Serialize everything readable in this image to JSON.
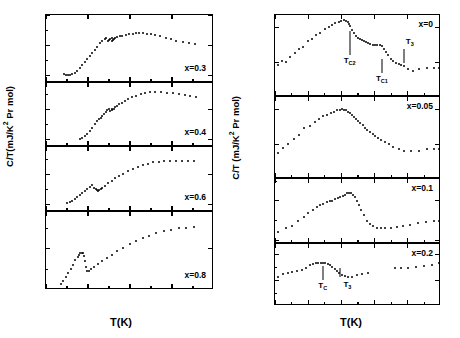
{
  "figure": {
    "background": "#ffffff",
    "marker_color": "#000000"
  },
  "left_group": {
    "ytitle": "C/T(mJ/K",
    "ytitle_sup": "2",
    "ytitle_tail": " Pr mol)",
    "xtitle": "T(K)"
  },
  "right_group": {
    "ytitle": "C/T (mJ/K",
    "ytitle_sup": "2",
    "ytitle_tail": " Pr mol)",
    "xtitle": "T(K)"
  },
  "chart_data": [
    {
      "id": "left-p1",
      "type": "scatter",
      "title": "",
      "xlabel": "T(K)",
      "ylabel": "C/T(mJ/K2 Pr mol)",
      "annotation": "x=0.3",
      "xlim": [
        0,
        4
      ],
      "ylim": [
        -250,
        2000
      ],
      "xticks": [
        0,
        1,
        2,
        3,
        4
      ],
      "xtick_labels": [
        "0",
        "1",
        "2",
        "3",
        "4"
      ],
      "xminor": [
        0.5,
        1.5,
        2.5,
        3.5
      ],
      "yticks": [
        0,
        1000,
        2000
      ],
      "ytick_labels": [
        "0",
        "1000",
        "2000"
      ],
      "yminor": [
        500,
        1500
      ],
      "grid": false,
      "x": [
        0.42,
        0.47,
        0.52,
        0.57,
        0.62,
        0.68,
        0.74,
        0.8,
        0.86,
        0.92,
        0.98,
        1.04,
        1.1,
        1.16,
        1.22,
        1.28,
        1.34,
        1.4,
        1.44,
        1.47,
        1.5,
        1.53,
        1.56,
        1.58,
        1.6,
        1.62,
        1.65,
        1.7,
        1.75,
        1.82,
        1.9,
        1.98,
        2.06,
        2.14,
        2.22,
        2.3,
        2.4,
        2.5,
        2.6,
        2.72,
        2.85,
        2.98,
        3.1,
        3.25,
        3.4,
        3.55
      ],
      "y": [
        60,
        30,
        20,
        25,
        45,
        80,
        150,
        230,
        330,
        430,
        540,
        640,
        740,
        850,
        950,
        1060,
        1140,
        1200,
        1230,
        1140,
        1165,
        1200,
        1230,
        1130,
        1160,
        1200,
        1230,
        1260,
        1290,
        1320,
        1345,
        1365,
        1380,
        1390,
        1395,
        1390,
        1380,
        1360,
        1335,
        1300,
        1250,
        1200,
        1150,
        1110,
        1075,
        1045
      ]
    },
    {
      "id": "left-p2",
      "type": "scatter",
      "annotation": "x=0.4",
      "xlim": [
        0,
        4
      ],
      "ylim": [
        -250,
        1900
      ],
      "xticks": [
        0,
        1,
        2,
        3,
        4
      ],
      "xtick_labels": [
        "",
        "",
        "",
        "",
        ""
      ],
      "xminor": [
        0.5,
        1.5,
        2.5,
        3.5
      ],
      "yticks": [
        0,
        1000
      ],
      "ytick_labels": [
        "0",
        "1000"
      ],
      "yminor": [
        500,
        1500
      ],
      "grid": false,
      "x": [
        0.8,
        0.86,
        0.92,
        0.98,
        1.04,
        1.1,
        1.16,
        1.22,
        1.26,
        1.3,
        1.34,
        1.38,
        1.42,
        1.46,
        1.5,
        1.53,
        1.56,
        1.58,
        1.61,
        1.64,
        1.68,
        1.73,
        1.8,
        1.88,
        1.96,
        2.05,
        2.15,
        2.25,
        2.36,
        2.48,
        2.6,
        2.74,
        2.88,
        3.02,
        3.16,
        3.3,
        3.44,
        3.58
      ],
      "y": [
        30,
        60,
        110,
        180,
        280,
        400,
        520,
        620,
        690,
        740,
        800,
        860,
        920,
        980,
        1040,
        960,
        980,
        1010,
        1040,
        1080,
        1130,
        1180,
        1240,
        1300,
        1360,
        1420,
        1470,
        1520,
        1560,
        1590,
        1610,
        1600,
        1580,
        1550,
        1520,
        1490,
        1455,
        1420
      ]
    },
    {
      "id": "left-p3",
      "type": "scatter",
      "annotation": "x=0.6",
      "xlim": [
        0,
        4
      ],
      "ylim": [
        -250,
        1900
      ],
      "xticks": [
        0,
        1,
        2,
        3,
        4
      ],
      "xtick_labels": [
        "",
        "",
        "",
        "",
        ""
      ],
      "xminor": [
        0.5,
        1.5,
        2.5,
        3.5
      ],
      "yticks": [
        0,
        1000
      ],
      "ytick_labels": [
        "0",
        "1000"
      ],
      "yminor": [
        500,
        1500
      ],
      "grid": false,
      "x": [
        0.5,
        0.56,
        0.62,
        0.68,
        0.74,
        0.8,
        0.86,
        0.92,
        0.98,
        1.04,
        1.1,
        1.14,
        1.18,
        1.21,
        1.24,
        1.27,
        1.3,
        1.34,
        1.4,
        1.48,
        1.56,
        1.64,
        1.74,
        1.84,
        1.95,
        2.06,
        2.18,
        2.3,
        2.42,
        2.55,
        2.68,
        2.82,
        2.96,
        3.1,
        3.24,
        3.38,
        3.52
      ],
      "y": [
        40,
        80,
        130,
        190,
        250,
        320,
        390,
        455,
        520,
        580,
        640,
        560,
        520,
        480,
        450,
        480,
        510,
        560,
        620,
        700,
        780,
        860,
        940,
        1020,
        1100,
        1170,
        1240,
        1300,
        1350,
        1390,
        1420,
        1440,
        1445,
        1440,
        1440,
        1440,
        1440
      ]
    },
    {
      "id": "left-p4",
      "type": "scatter",
      "annotation": "x=0.8",
      "xlim": [
        0,
        4
      ],
      "ylim": [
        0,
        1900
      ],
      "xticks": [
        0,
        1,
        2,
        3,
        4
      ],
      "xtick_labels": [
        "0",
        "1",
        "2",
        "3",
        "4"
      ],
      "xminor": [
        0.5,
        1.5,
        2.5,
        3.5
      ],
      "yticks": [
        0,
        1000
      ],
      "ytick_labels": [
        "0",
        "1000"
      ],
      "yminor": [
        500,
        1500
      ],
      "grid": false,
      "x": [
        0.35,
        0.41,
        0.47,
        0.53,
        0.59,
        0.65,
        0.7,
        0.75,
        0.79,
        0.82,
        0.85,
        0.88,
        0.9,
        0.92,
        0.95,
        0.98,
        1.02,
        1.08,
        1.15,
        1.24,
        1.34,
        1.45,
        1.57,
        1.7,
        1.84,
        1.99,
        2.14,
        2.3,
        2.46,
        2.62,
        2.8,
        2.98,
        3.16,
        3.34,
        3.52
      ],
      "y": [
        150,
        230,
        320,
        420,
        520,
        620,
        720,
        800,
        860,
        900,
        905,
        890,
        840,
        700,
        560,
        470,
        460,
        500,
        560,
        630,
        700,
        780,
        860,
        940,
        1030,
        1110,
        1190,
        1260,
        1320,
        1380,
        1430,
        1470,
        1500,
        1520,
        1535
      ]
    },
    {
      "id": "right-p1",
      "type": "scatter",
      "xlabel": "T(K)",
      "ylabel": "C/T (mJ/K2 Pr mol)",
      "annotation": "x=0",
      "xlim": [
        1.5,
        2.0
      ],
      "ylim": [
        2500,
        3680
      ],
      "xticks": [
        1.5,
        1.6,
        1.7,
        1.8,
        1.9,
        2.0
      ],
      "xtick_labels": [
        "1.5",
        "1.6",
        "1.7",
        "1.8",
        "1.9",
        "2.0"
      ],
      "xminor": [
        1.55,
        1.65,
        1.75,
        1.85,
        1.95
      ],
      "yticks": [
        2500,
        3000,
        3500
      ],
      "ytick_labels": [
        "2500",
        "3000",
        "3500"
      ],
      "grid": false,
      "markers": [
        {
          "label": "T_C2",
          "text": "T",
          "sub": "C2",
          "x": 1.725
        },
        {
          "label": "T_C1",
          "text": "T",
          "sub": "C1",
          "x": 1.822
        },
        {
          "label": "T_3",
          "text": "T",
          "sub": "3",
          "x": 1.888
        }
      ],
      "x": [
        1.508,
        1.52,
        1.533,
        1.546,
        1.559,
        1.572,
        1.585,
        1.598,
        1.611,
        1.624,
        1.637,
        1.65,
        1.662,
        1.672,
        1.682,
        1.692,
        1.7,
        1.708,
        1.714,
        1.719,
        1.723,
        1.727,
        1.732,
        1.738,
        1.744,
        1.75,
        1.756,
        1.762,
        1.768,
        1.774,
        1.78,
        1.787,
        1.794,
        1.801,
        1.808,
        1.815,
        1.821,
        1.827,
        1.834,
        1.841,
        1.848,
        1.856,
        1.864,
        1.872,
        1.88,
        1.889,
        1.9,
        1.915,
        1.935,
        1.958,
        1.978,
        1.994
      ],
      "y": [
        2960,
        3020,
        3000,
        3075,
        3130,
        3185,
        3215,
        3300,
        3340,
        3390,
        3420,
        3475,
        3510,
        3540,
        3565,
        3580,
        3595,
        3605,
        3600,
        3580,
        3555,
        3520,
        3470,
        3420,
        3385,
        3350,
        3330,
        3315,
        3300,
        3285,
        3270,
        3260,
        3255,
        3250,
        3250,
        3250,
        3230,
        3190,
        3150,
        3100,
        3050,
        3020,
        2995,
        2975,
        2960,
        2940,
        2900,
        2870,
        2900,
        2920,
        2915,
        2915
      ]
    },
    {
      "id": "right-p2",
      "type": "scatter",
      "annotation": "x=0.05",
      "xlim": [
        1.5,
        2.0
      ],
      "ylim": [
        2500,
        3680
      ],
      "xticks": [
        1.5,
        1.6,
        1.7,
        1.8,
        1.9,
        2.0
      ],
      "xtick_labels": [
        "",
        "",
        "",
        "",
        "",
        ""
      ],
      "xminor": [
        1.55,
        1.65,
        1.75,
        1.85,
        1.95
      ],
      "yticks": [
        2500,
        3000,
        3500
      ],
      "ytick_labels": [
        "2500",
        "3000",
        "3500"
      ],
      "grid": false,
      "x": [
        1.508,
        1.524,
        1.54,
        1.556,
        1.572,
        1.588,
        1.604,
        1.62,
        1.634,
        1.646,
        1.658,
        1.668,
        1.678,
        1.687,
        1.695,
        1.702,
        1.708,
        1.714,
        1.72,
        1.726,
        1.732,
        1.738,
        1.744,
        1.75,
        1.757,
        1.764,
        1.771,
        1.778,
        1.786,
        1.794,
        1.802,
        1.81,
        1.82,
        1.83,
        1.842,
        1.856,
        1.872,
        1.89,
        1.91,
        1.934,
        1.958,
        1.98,
        1.995
      ],
      "y": [
        2880,
        2950,
        3000,
        3080,
        3140,
        3230,
        3265,
        3325,
        3360,
        3400,
        3420,
        3450,
        3470,
        3490,
        3500,
        3505,
        3500,
        3490,
        3470,
        3445,
        3420,
        3390,
        3360,
        3330,
        3300,
        3270,
        3240,
        3210,
        3180,
        3150,
        3120,
        3090,
        3060,
        3030,
        3000,
        2960,
        2930,
        2905,
        2900,
        2905,
        2925,
        2930,
        2930
      ]
    },
    {
      "id": "right-p3",
      "type": "scatter",
      "annotation": "x=0.1",
      "xlim": [
        1.5,
        2.0
      ],
      "ylim": [
        1950,
        2780
      ],
      "xticks": [
        1.5,
        1.6,
        1.7,
        1.8,
        1.9,
        2.0
      ],
      "xtick_labels": [
        "",
        "",
        "",
        "",
        "",
        ""
      ],
      "xminor": [
        1.55,
        1.65,
        1.75,
        1.85,
        1.95
      ],
      "yticks": [
        2000,
        2500
      ],
      "ytick_labels": [
        "2000",
        "2500"
      ],
      "yminor": [
        2250,
        2750
      ],
      "grid": false,
      "x": [
        1.51,
        1.532,
        1.552,
        1.57,
        1.586,
        1.6,
        1.613,
        1.625,
        1.636,
        1.646,
        1.656,
        1.665,
        1.673,
        1.681,
        1.689,
        1.697,
        1.704,
        1.711,
        1.717,
        1.723,
        1.729,
        1.735,
        1.741,
        1.747,
        1.753,
        1.76,
        1.768,
        1.776,
        1.785,
        1.795,
        1.806,
        1.818,
        1.832,
        1.848,
        1.866,
        1.886,
        1.908,
        1.932,
        1.956,
        1.978,
        1.995
      ],
      "y": [
        2105,
        2150,
        2180,
        2240,
        2300,
        2350,
        2390,
        2420,
        2450,
        2465,
        2480,
        2495,
        2505,
        2520,
        2535,
        2550,
        2565,
        2580,
        2595,
        2605,
        2600,
        2580,
        2545,
        2500,
        2450,
        2390,
        2320,
        2250,
        2200,
        2175,
        2160,
        2155,
        2155,
        2160,
        2165,
        2175,
        2195,
        2215,
        2230,
        2240,
        2240
      ]
    },
    {
      "id": "right-p4",
      "type": "scatter",
      "annotation": "x=0.2",
      "xlim": [
        1.5,
        2.0
      ],
      "ylim": [
        1000,
        2200
      ],
      "xticks": [
        1.5,
        1.6,
        1.7,
        1.8,
        1.9,
        2.0
      ],
      "xtick_labels": [
        "1.5",
        "1.6",
        "1.7",
        "1.8",
        "1.9",
        "2.0"
      ],
      "xminor": [
        1.55,
        1.65,
        1.75,
        1.85,
        1.95
      ],
      "yticks": [
        1000,
        1500,
        2000
      ],
      "ytick_labels": [
        "1000",
        "1500",
        "2000"
      ],
      "yminor": [
        1250,
        1750
      ],
      "grid": false,
      "markers": [
        {
          "label": "T_C",
          "text": "T",
          "sub": "C",
          "x": 1.644
        },
        {
          "label": "T_3",
          "text": "T",
          "sub": "3",
          "x": 1.697
        }
      ],
      "x": [
        1.51,
        1.524,
        1.538,
        1.552,
        1.566,
        1.58,
        1.593,
        1.604,
        1.614,
        1.623,
        1.631,
        1.638,
        1.645,
        1.652,
        1.659,
        1.666,
        1.673,
        1.68,
        1.687,
        1.694,
        1.701,
        1.71,
        1.72,
        1.732,
        1.746,
        1.762,
        1.78,
        1.86,
        1.88,
        1.902,
        1.926,
        1.95,
        1.974,
        1.994
      ],
      "y": [
        1560,
        1610,
        1640,
        1660,
        1680,
        1700,
        1740,
        1790,
        1820,
        1835,
        1840,
        1840,
        1835,
        1825,
        1810,
        1790,
        1760,
        1720,
        1680,
        1640,
        1600,
        1575,
        1560,
        1570,
        1600,
        1625,
        1640,
        1730,
        1740,
        1745,
        1755,
        1770,
        1790,
        1840
      ]
    }
  ]
}
